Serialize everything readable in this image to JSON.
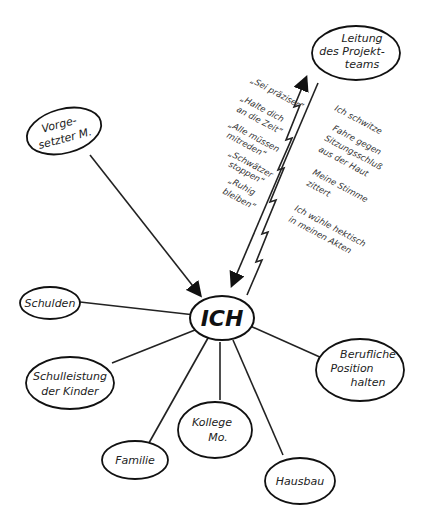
{
  "diagram": {
    "center": {
      "label": "ICH"
    },
    "nodes": [
      {
        "id": "leitung",
        "lines": [
          "Leitung",
          "des Projekt-",
          "teams"
        ]
      },
      {
        "id": "vorgesetzter",
        "lines": [
          "Vorge-",
          "setzter M."
        ]
      },
      {
        "id": "schulden",
        "lines": [
          "Schulden"
        ]
      },
      {
        "id": "schulleistung",
        "lines": [
          "Schulleistung",
          "der Kinder"
        ]
      },
      {
        "id": "familie",
        "lines": [
          "Familie"
        ]
      },
      {
        "id": "kollege",
        "lines": [
          "Kollege",
          "Mo."
        ]
      },
      {
        "id": "hausbau",
        "lines": [
          "Hausbau"
        ]
      },
      {
        "id": "position",
        "lines": [
          "Berufliche",
          "Position",
          "halten"
        ]
      }
    ],
    "demands_left": [
      [
        "„Sei präziser“"
      ],
      [
        "„Halte dich",
        "an die Zeit“"
      ],
      [
        "„Alle müssen",
        "mitreden“"
      ],
      [
        "„Schwätzer",
        "stoppen“"
      ],
      [
        "„Ruhig",
        "bleiben“"
      ]
    ],
    "reactions_right": [
      [
        "Ich schwitze"
      ],
      [
        "Fahre gegen",
        "Sitzungsschluß",
        "aus der Haut"
      ],
      [
        "Meine Stimme",
        "zittert"
      ],
      [
        "Ich wühle hektisch",
        "in meinen Akten"
      ]
    ]
  }
}
